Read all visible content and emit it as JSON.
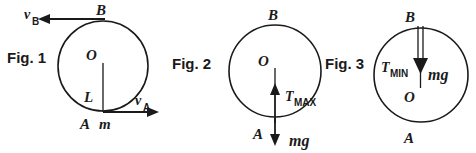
{
  "document": {
    "title": "Vertical circular motion force diagrams",
    "background_color": "#ffffff",
    "ink_color": "#1a1a1a"
  },
  "figures": [
    {
      "caption": "Fig. 1",
      "description": "Circle with centre O, lowest point A carrying mass m, highest point B; velocity vectors at A and B; radius L drawn from O to A.",
      "labels": {
        "center": "O",
        "top_point": "B",
        "bottom_point": "A",
        "mass": "m",
        "radius": "L",
        "velocity_bottom_base": "v",
        "velocity_bottom_sub": "A",
        "velocity_top_base": "v",
        "velocity_top_sub": "B"
      },
      "vectors": [
        {
          "name": "v_A",
          "at": "A",
          "direction": "right"
        },
        {
          "name": "v_B",
          "at": "B",
          "direction": "left"
        }
      ]
    },
    {
      "caption": "Fig. 2",
      "description": "Circle with centre O, lowest point A, highest point B; tension T_MAX acts upward at A and weight mg acts downward at A.",
      "labels": {
        "center": "O",
        "top_point": "B",
        "bottom_point": "A",
        "tension_base": "T",
        "tension_sub": "MAX",
        "weight": "mg"
      },
      "vectors": [
        {
          "name": "T_MAX",
          "at": "A",
          "direction": "up"
        },
        {
          "name": "mg",
          "at": "A",
          "direction": "down"
        }
      ]
    },
    {
      "caption": "Fig. 3",
      "description": "Circle with centre O, highest point B, lowest point A; tension T_MIN and weight mg both act downward at B.",
      "labels": {
        "center": "O",
        "top_point": "B",
        "bottom_point": "A",
        "tension_base": "T",
        "tension_sub": "MIN",
        "weight": "mg"
      },
      "vectors": [
        {
          "name": "T_MIN",
          "at": "B",
          "direction": "down"
        },
        {
          "name": "mg",
          "at": "B",
          "direction": "down"
        }
      ]
    }
  ]
}
